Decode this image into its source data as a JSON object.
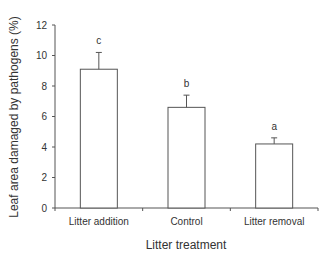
{
  "chart_data": {
    "type": "bar",
    "title": "",
    "xlabel": "Litter treatment",
    "ylabel": "Leaf area damaged by pathogens (%)",
    "categories": [
      "Litter addition",
      "Control",
      "Litter removal"
    ],
    "values": [
      9.1,
      6.6,
      4.2
    ],
    "error_upper": [
      1.1,
      0.8,
      0.4
    ],
    "significance_letters": [
      "c",
      "b",
      "a"
    ],
    "ylim": [
      0,
      12
    ],
    "yticks": [
      0,
      2,
      4,
      6,
      8,
      10,
      12
    ],
    "grid": false,
    "legend": null,
    "bar_fill": "#ffffff",
    "bar_stroke": "#555555"
  }
}
